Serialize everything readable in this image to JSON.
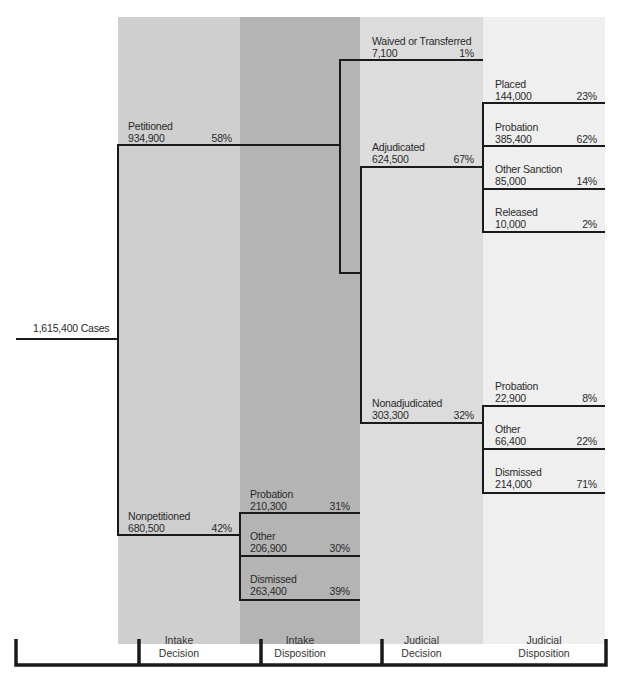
{
  "total": {
    "label": "1,615,400 Cases",
    "value": 1615400
  },
  "columns": [
    {
      "label": "Intake\nDecision",
      "line1": "Intake",
      "line2": "Decision",
      "color": "#cfcfcf"
    },
    {
      "label": "Intake\nDisposition",
      "line1": "Intake",
      "line2": "Disposition",
      "color": "#b4b4b4"
    },
    {
      "label": "Judicial\nDecision",
      "line1": "Judicial",
      "line2": "Decision",
      "color": "#dcdcdc"
    },
    {
      "label": "Judicial\nDisposition",
      "line1": "Judicial",
      "line2": "Disposition",
      "color": "#efefef"
    }
  ],
  "nodes": {
    "petitioned": {
      "name": "Petitioned",
      "count": "934,900",
      "pct": "58%"
    },
    "nonpetitioned": {
      "name": "Nonpetitioned",
      "count": "680,500",
      "pct": "42%"
    },
    "np_probation": {
      "name": "Probation",
      "count": "210,300",
      "pct": "31%"
    },
    "np_other": {
      "name": "Other",
      "count": "206,900",
      "pct": "30%"
    },
    "np_dismissed": {
      "name": "Dismissed",
      "count": "263,400",
      "pct": "39%"
    },
    "waived": {
      "name": "Waived or Transferred",
      "count": "7,100",
      "pct": "1%"
    },
    "adjudicated": {
      "name": "Adjudicated",
      "count": "624,500",
      "pct": "67%"
    },
    "nonadjudicated": {
      "name": "Nonadjudicated",
      "count": "303,300",
      "pct": "32%"
    },
    "adj_placed": {
      "name": "Placed",
      "count": "144,000",
      "pct": "23%"
    },
    "adj_probation": {
      "name": "Probation",
      "count": "385,400",
      "pct": "62%"
    },
    "adj_other": {
      "name": "Other Sanction",
      "count": "85,000",
      "pct": "14%"
    },
    "adj_released": {
      "name": "Released",
      "count": "10,000",
      "pct": "2%"
    },
    "nadj_probation": {
      "name": "Probation",
      "count": "22,900",
      "pct": "8%"
    },
    "nadj_other": {
      "name": "Other",
      "count": "66,400",
      "pct": "22%"
    },
    "nadj_dismissed": {
      "name": "Dismissed",
      "count": "214,000",
      "pct": "71%"
    }
  }
}
